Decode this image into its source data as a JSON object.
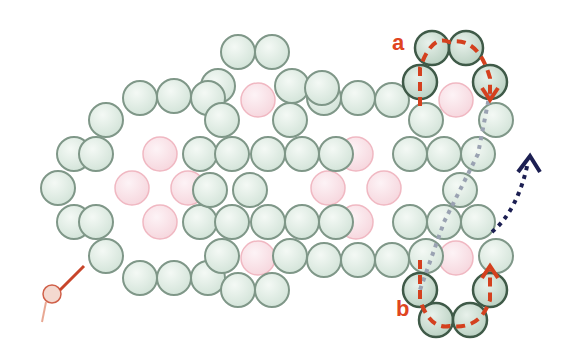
{
  "diagram": {
    "colors": {
      "green_fill": "#dfece4",
      "green_stroke": "#7f9788",
      "dark_stroke": "#3f5a48",
      "pink_fill": "#f8dfe4",
      "pink_stroke": "#f0b8c2",
      "red_path": "#d4401e",
      "grey_path": "#9aa2b2",
      "navy_path": "#1c1f52",
      "thread": "#c8452a"
    },
    "bead_radius": 17,
    "green_beads": [
      [
        238,
        52
      ],
      [
        272,
        52
      ],
      [
        218,
        86
      ],
      [
        292,
        86
      ],
      [
        58,
        188
      ],
      [
        74,
        154
      ],
      [
        74,
        222
      ],
      [
        106,
        120
      ],
      [
        106,
        256
      ],
      [
        140,
        98
      ],
      [
        174,
        96
      ],
      [
        208,
        98
      ],
      [
        140,
        278
      ],
      [
        174,
        278
      ],
      [
        208,
        278
      ],
      [
        96,
        154
      ],
      [
        96,
        222
      ],
      [
        200,
        154
      ],
      [
        200,
        222
      ],
      [
        222,
        120
      ],
      [
        222,
        256
      ],
      [
        210,
        190
      ],
      [
        232,
        154
      ],
      [
        268,
        154
      ],
      [
        302,
        154
      ],
      [
        336,
        154
      ],
      [
        232,
        222
      ],
      [
        268,
        222
      ],
      [
        302,
        222
      ],
      [
        336,
        222
      ],
      [
        250,
        190
      ],
      [
        290,
        120
      ],
      [
        290,
        256
      ],
      [
        324,
        98
      ],
      [
        358,
        98
      ],
      [
        392,
        100
      ],
      [
        324,
        260
      ],
      [
        358,
        260
      ],
      [
        392,
        260
      ],
      [
        238,
        290
      ],
      [
        272,
        290
      ],
      [
        410,
        154
      ],
      [
        410,
        222
      ],
      [
        426,
        120
      ],
      [
        426,
        256
      ],
      [
        444,
        154
      ],
      [
        478,
        154
      ],
      [
        460,
        190
      ],
      [
        444,
        222
      ],
      [
        478,
        222
      ],
      [
        496,
        120
      ],
      [
        496,
        256
      ],
      [
        322,
        88
      ]
    ],
    "dark_beads": [
      [
        432,
        48
      ],
      [
        466,
        48
      ],
      [
        420,
        82
      ],
      [
        490,
        82
      ],
      [
        420,
        290
      ],
      [
        490,
        290
      ],
      [
        436,
        320
      ],
      [
        470,
        320
      ]
    ],
    "pink_beads": [
      [
        160,
        154
      ],
      [
        132,
        188
      ],
      [
        188,
        188
      ],
      [
        160,
        222
      ],
      [
        258,
        100
      ],
      [
        258,
        258
      ],
      [
        356,
        154
      ],
      [
        328,
        188
      ],
      [
        384,
        188
      ],
      [
        356,
        222
      ],
      [
        456,
        100
      ],
      [
        456,
        258
      ]
    ],
    "labels": {
      "a": "a",
      "b": "b"
    },
    "clasp": {
      "x": 52,
      "y": 292
    }
  }
}
